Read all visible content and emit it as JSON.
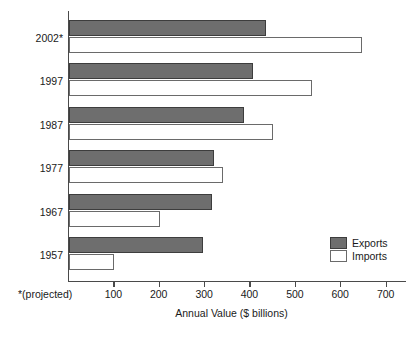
{
  "chart_data": {
    "type": "bar",
    "orientation": "horizontal",
    "title": "",
    "xlabel": "Annual Value ($ billions)",
    "ylabel": "",
    "categories": [
      "2002*",
      "1997",
      "1987",
      "1977",
      "1967",
      "1957"
    ],
    "series": [
      {
        "name": "Exports",
        "color": "#6e6e6e",
        "values": [
          435,
          405,
          385,
          320,
          315,
          295
        ]
      },
      {
        "name": "Imports",
        "color": "#ffffff",
        "values": [
          645,
          535,
          450,
          340,
          200,
          100
        ]
      }
    ],
    "xlim": [
      0,
      745
    ],
    "xticks": [
      100,
      200,
      300,
      400,
      500,
      600,
      700
    ],
    "xtick_labels": [
      "100",
      "200",
      "300",
      "400",
      "500",
      "600",
      "700"
    ],
    "grid": false,
    "legend_position": "bottom-right",
    "footnote": "*(projected)"
  },
  "legend": {
    "items": [
      {
        "label": "Exports"
      },
      {
        "label": "Imports"
      }
    ]
  }
}
